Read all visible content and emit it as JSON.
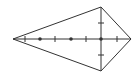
{
  "diagram": {
    "type": "kite",
    "stroke_color": "#333333",
    "background": "#ffffff",
    "vertices": {
      "left": [
        13,
        39
      ],
      "top": [
        101,
        7
      ],
      "right": [
        131,
        39
      ],
      "bottom": [
        101,
        71
      ]
    },
    "intersection": [
      101,
      39
    ],
    "horizontal_diagonal": {
      "from": [
        13,
        39
      ],
      "to": [
        131,
        39
      ]
    },
    "vertical_diagonal": {
      "from": [
        101,
        7
      ],
      "to": [
        101,
        71
      ]
    },
    "dots": [
      [
        40,
        39
      ],
      [
        71,
        39
      ],
      [
        101,
        39
      ]
    ],
    "horizontal_ticks": [
      25,
      55,
      86,
      117
    ],
    "vertical_ticks": [
      23,
      55
    ]
  }
}
